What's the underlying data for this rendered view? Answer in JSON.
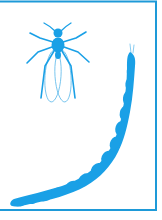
{
  "figure": {
    "colors": {
      "primary": "#1aa0e6",
      "border": "#1e9ad8",
      "wing_outline": "#5bb8ea",
      "background": "#ffffff"
    },
    "elements": [
      {
        "name": "adult-insect",
        "label": ""
      },
      {
        "name": "larva",
        "label": ""
      }
    ]
  }
}
